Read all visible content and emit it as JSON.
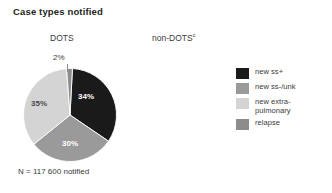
{
  "panel": {
    "title": "Case types notified"
  },
  "columns": {
    "dots": {
      "heading": "DOTS",
      "caption": "N = 117 600 notified"
    },
    "non_dots": {
      "heading": "non-DOTS",
      "heading_superscript": "c",
      "caption": ""
    }
  },
  "legend": {
    "position": "right",
    "items": [
      {
        "label": "new ss+",
        "color": "#1a1a1a",
        "name": "new-ss-positive"
      },
      {
        "label": "new ss-/unk",
        "color": "#9a9a9a",
        "name": "new-ss-negative-unknown"
      },
      {
        "label": "new extra-\npulmonary",
        "color": "#d4d4d4",
        "name": "new-extra-pulmonary"
      },
      {
        "label": "relapse",
        "color": "#8c8c8c",
        "name": "relapse"
      }
    ]
  },
  "chart_data": {
    "type": "pie",
    "title": "Case types notified",
    "subtitle": "DOTS",
    "categories": [
      "new ss+",
      "new ss-/unk",
      "new extra-pulmonary",
      "relapse"
    ],
    "values": [
      34,
      30,
      35,
      2
    ],
    "value_labels": [
      "34%",
      "30%",
      "35%",
      "2%"
    ],
    "colors": [
      "#1a1a1a",
      "#9a9a9a",
      "#d4d4d4",
      "#8c8c8c"
    ],
    "units": "percent",
    "total_label": "N = 117 600 notified",
    "total": 117600,
    "start_angle_deg": 3,
    "direction": "clockwise",
    "legend_position": "right",
    "grid": false
  }
}
